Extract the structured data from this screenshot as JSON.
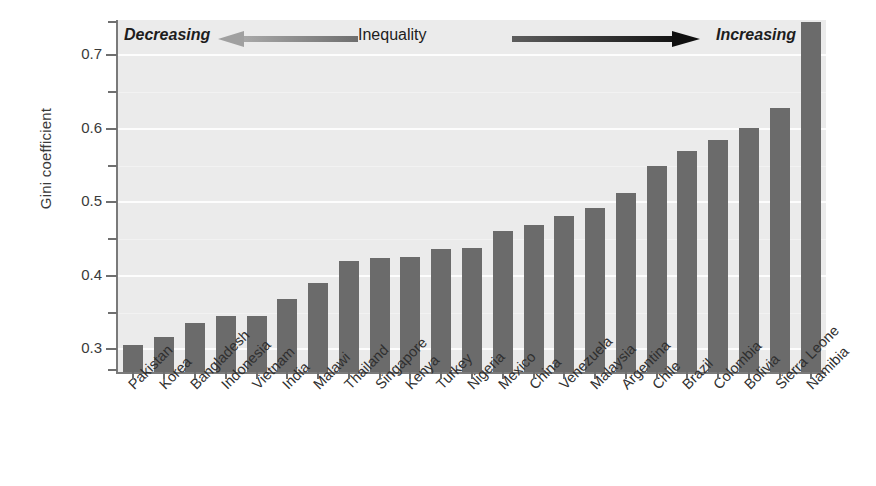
{
  "chart_data": {
    "type": "bar",
    "title": "",
    "subtitle": "",
    "xlabel": "",
    "ylabel": "Gini coefficient",
    "ylim": [
      0.268,
      0.748
    ],
    "grid": true,
    "legend": "none",
    "y_ticks_major": [
      "0.3",
      "0.4",
      "0.5",
      "0.6",
      "0.7"
    ],
    "y_tick_values_major": [
      0.3,
      0.4,
      0.5,
      0.6,
      0.7
    ],
    "y_tick_values_minor": [
      0.35,
      0.45,
      0.55,
      0.65
    ],
    "bar_color": "#6b6b6b",
    "plot_background": "#ebebeb",
    "gridline_color": "#fdfdfd",
    "categories": [
      "Pakistan",
      "Korea",
      "Bangladesh",
      "Indonesia",
      "Vietnam",
      "India",
      "Malawi",
      "Thailand",
      "Singapore",
      "Kenya",
      "Turkey",
      "Nigeria",
      "Mexico",
      "China",
      "Venezuela",
      "Malaysia",
      "Argentina",
      "Chile",
      "Brazil",
      "Colombia",
      "Bolivia",
      "Sierra Leone",
      "Namibia"
    ],
    "values": [
      0.306,
      0.317,
      0.336,
      0.345,
      0.345,
      0.368,
      0.39,
      0.42,
      0.425,
      0.426,
      0.437,
      0.438,
      0.461,
      0.469,
      0.481,
      0.492,
      0.513,
      0.55,
      0.57,
      0.585,
      0.601,
      0.629,
      0.745
    ],
    "annotations": {
      "left_text": "Decreasing",
      "center_text": "Inequality",
      "right_text": "Increasing",
      "left_arrow_direction": "left",
      "right_arrow_direction": "right",
      "left_arrow_color": "#8c8c8c",
      "right_arrow_color": "#1a1a1a"
    }
  }
}
